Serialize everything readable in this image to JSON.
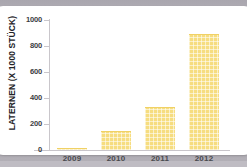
{
  "card": {
    "background_color": "#ffffff",
    "frame_color": "#b2afb6"
  },
  "chart_data": {
    "type": "bar",
    "title": "",
    "subtitle": "",
    "xlabel": "",
    "ylabel": "LATERNEN (X 1000 STÜCK)",
    "categories": [
      "2009",
      "2010",
      "2011",
      "2012"
    ],
    "values": [
      5,
      140,
      325,
      885
    ],
    "series": [
      {
        "name": "Laternen",
        "values": [
          5,
          140,
          325,
          885
        ],
        "color": "#f6dd80"
      }
    ],
    "ylim": [
      0,
      1000
    ],
    "yticks": [
      0,
      200,
      400,
      600,
      800,
      1000
    ],
    "ytick_labels": [
      "0",
      "200",
      "400",
      "600",
      "800",
      "1000"
    ],
    "grid": false,
    "legend": false,
    "legend_position": "none",
    "bar_color": "#f6dd80",
    "bar_pattern": "cross-hatch",
    "axis_color": "#c9c6cb",
    "tick_label_color": "#3b3b3f"
  }
}
